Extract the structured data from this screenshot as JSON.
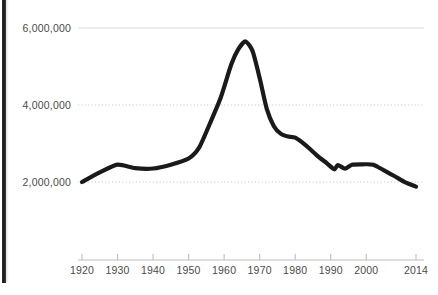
{
  "chart_data": {
    "type": "line",
    "title": "",
    "subtitle": "",
    "xlabel": "",
    "ylabel": "",
    "xlim": [
      1920,
      2014
    ],
    "ylim": [
      1600000,
      6250000
    ],
    "grid": true,
    "legend": false,
    "legend_position": "none",
    "line_color": "#1a1a1a",
    "grid_color": "#c9c9c9",
    "axis_color": "#bdbdbd",
    "label_color": "#4a4a4a",
    "background": "#ffffff",
    "y_ticks": [
      2000000,
      4000000,
      6000000
    ],
    "y_tick_labels": [
      "2,000,000",
      "4,000,000",
      "6,000,000"
    ],
    "x_ticks": [
      1920,
      1930,
      1940,
      1950,
      1960,
      1970,
      1980,
      1990,
      2000,
      2014
    ],
    "x_tick_labels": [
      "1920",
      "1930",
      "1940",
      "1950",
      "1960",
      "1970",
      "1980",
      "1990",
      "2000",
      "2014"
    ],
    "series": [
      {
        "name": "series-1",
        "color": "#1a1a1a",
        "x": [
          1920,
          1925,
          1930,
          1935,
          1940,
          1945,
          1950,
          1953,
          1956,
          1959,
          1962,
          1964,
          1966,
          1968,
          1970,
          1972,
          1974,
          1976,
          1978,
          1980,
          1983,
          1986,
          1989,
          1991,
          1992,
          1994,
          1996,
          1999,
          2002,
          2005,
          2008,
          2011,
          2014
        ],
        "y": [
          2000000,
          2250000,
          2450000,
          2360000,
          2350000,
          2450000,
          2610000,
          2900000,
          3520000,
          4180000,
          5050000,
          5450000,
          5650000,
          5400000,
          4700000,
          3900000,
          3450000,
          3250000,
          3180000,
          3150000,
          2950000,
          2700000,
          2480000,
          2330000,
          2440000,
          2350000,
          2450000,
          2460000,
          2450000,
          2300000,
          2150000,
          1990000,
          1880000
        ]
      }
    ],
    "annotations": []
  },
  "decorations": {
    "left_edge_bar": "page-edge-bar"
  }
}
